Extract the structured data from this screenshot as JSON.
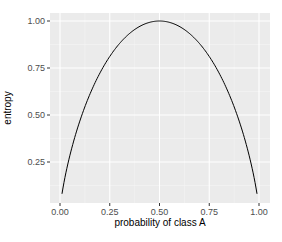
{
  "chart_data": {
    "type": "line",
    "title": "",
    "xlabel": "probability of class A",
    "ylabel": "entropy",
    "xlim": [
      -0.05,
      1.05
    ],
    "ylim": [
      0.03,
      1.05
    ],
    "grid": true,
    "legend": null,
    "x_ticks": [
      "0.00",
      "0.25",
      "0.50",
      "0.75",
      "1.00"
    ],
    "y_ticks": [
      "0.25",
      "0.50",
      "0.75",
      "1.00"
    ],
    "series": [
      {
        "name": "entropy",
        "formula": "-p*log2(p) - (1-p)*log2(1-p)",
        "x": [
          0.01,
          0.05,
          0.1,
          0.15,
          0.2,
          0.25,
          0.3,
          0.35,
          0.4,
          0.45,
          0.5,
          0.55,
          0.6,
          0.65,
          0.7,
          0.75,
          0.8,
          0.85,
          0.9,
          0.95,
          0.99
        ],
        "values": [
          0.081,
          0.286,
          0.469,
          0.61,
          0.722,
          0.811,
          0.881,
          0.934,
          0.971,
          0.993,
          1.0,
          0.993,
          0.971,
          0.934,
          0.881,
          0.811,
          0.722,
          0.61,
          0.469,
          0.286,
          0.081
        ]
      }
    ],
    "colors": {
      "panel_bg": "#ebebeb",
      "grid_major": "#ffffff",
      "line": "#000000",
      "tick_text": "#4d4d4d"
    }
  }
}
